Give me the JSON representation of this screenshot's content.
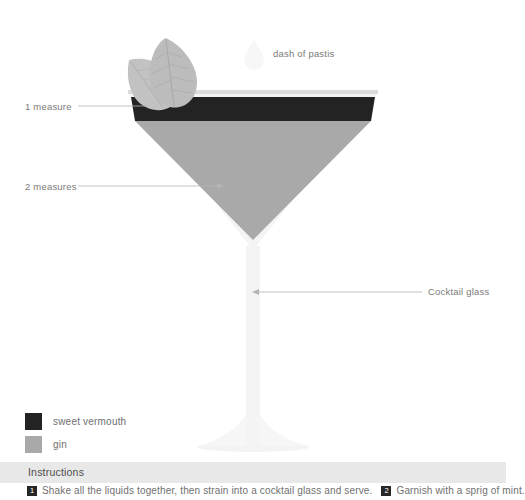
{
  "palette": {
    "background": "#ffffff",
    "vermouth": "#232323",
    "gin": "#a9a9a9",
    "glass": "#f2f2f2",
    "rim": "#dcdcdc",
    "mint": "#bdbdbd",
    "pastis_drop": "#f7f7f7",
    "leader_line": "#b4b4b4",
    "instructions_bar": "#e8e8e8",
    "text": "#7a7a7a",
    "badge": "#262626"
  },
  "annotations": {
    "one_measure": "1 measure",
    "two_measures": "2 measures",
    "dash_of_pastis": "dash of pastis",
    "cocktail_glass": "Cocktail glass"
  },
  "legend": {
    "items": [
      {
        "label": "sweet vermouth",
        "color": "#232323"
      },
      {
        "label": "gin",
        "color": "#a9a9a9"
      }
    ]
  },
  "instructions": {
    "title": "Instructions",
    "steps": [
      {
        "number": "1",
        "text": "Shake all the liquids together, then strain into a cocktail glass and serve."
      },
      {
        "number": "2",
        "text": "Garnish with a sprig of mint."
      }
    ]
  },
  "recipe_layers": [
    {
      "name": "sweet vermouth",
      "measure": "1 measure",
      "color": "#232323"
    },
    {
      "name": "gin",
      "measure": "2 measures",
      "color": "#a9a9a9"
    },
    {
      "name": "pastis",
      "measure": "dash of pastis",
      "color": "#f7f7f7"
    }
  ],
  "garnish": "sprig of mint"
}
